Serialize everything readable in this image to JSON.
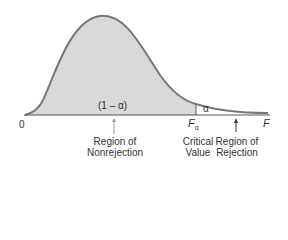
{
  "diagram": {
    "type": "F-distribution rejection region",
    "curve_fill": "#d9d9d9",
    "curve_stroke": "#777777",
    "axis_color": "#555555",
    "labels": {
      "origin": "0",
      "axis_end": "F",
      "critical_symbol": "F",
      "critical_subscript": "α",
      "nonrejection_area": "(1 – α)",
      "rejection_area": "α",
      "region_nonrejection_line1": "Region of",
      "region_nonrejection_line2": "Nonrejection",
      "critical_line1": "Critical",
      "critical_line2": "Value",
      "region_rejection_line1": "Region of",
      "region_rejection_line2": "Rejection"
    }
  }
}
